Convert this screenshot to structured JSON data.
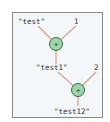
{
  "diagram": {
    "type": "expression-tree",
    "colors": {
      "frame_border": "#8a8a8a",
      "background": "#f4f7fa",
      "edge": "#d9a08a",
      "node_fill": "#9fd3a8",
      "node_stroke": "#3a6a44",
      "text": "#333333"
    },
    "nodes": [
      {
        "id": "op1",
        "symbol": "+",
        "x": 56,
        "y": 44
      },
      {
        "id": "op2",
        "symbol": "+",
        "x": 78,
        "y": 90
      }
    ],
    "labels": {
      "test": "\"test\"",
      "one": "1",
      "test1": "\"test1\"",
      "two": "2",
      "test12": "\"test12\""
    }
  }
}
